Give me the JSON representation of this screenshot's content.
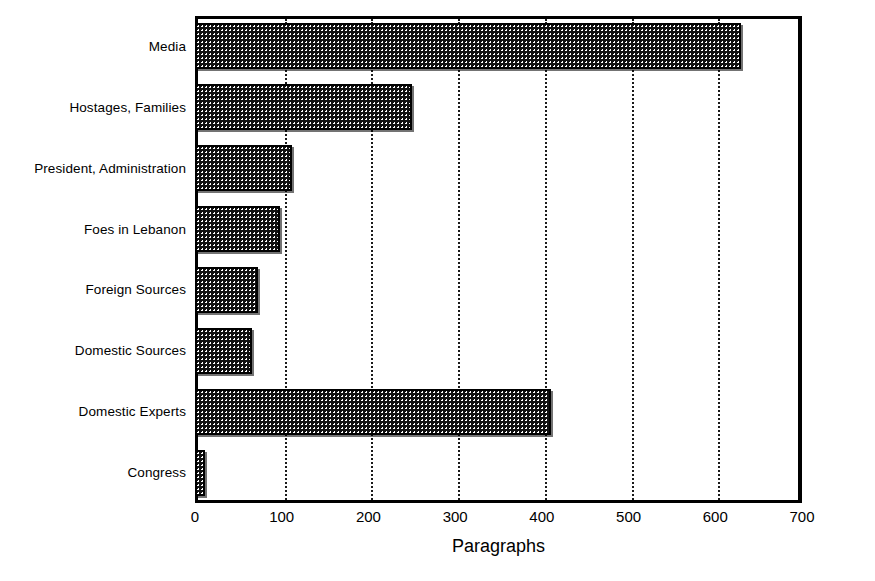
{
  "chart_data": {
    "type": "bar",
    "orientation": "horizontal",
    "title": "",
    "xlabel": "Paragraphs",
    "ylabel": "",
    "xlim": [
      0,
      700
    ],
    "xticks": [
      0,
      100,
      200,
      300,
      400,
      500,
      600,
      700
    ],
    "xticklabels": [
      "0",
      "100",
      "200",
      "300",
      "400",
      "500",
      "600",
      "700"
    ],
    "grid": "vertical-dotted",
    "legend": "none",
    "categories": [
      "Media",
      "Hostages, Families",
      "President, Administration",
      "Foes in Lebanon",
      "Foreign Sources",
      "Domestic Sources",
      "Domestic Experts",
      "Congress"
    ],
    "values": [
      630,
      250,
      112,
      98,
      73,
      66,
      410,
      11
    ],
    "bar_color": "#111111",
    "bar_pattern": "dotted-fill",
    "axis_color": "#000000",
    "background_color": "#ffffff"
  }
}
